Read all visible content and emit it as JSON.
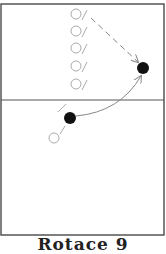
{
  "diagram": {
    "caption": "Rotace 9",
    "colors": {
      "frame": "#555555",
      "hollow": "#aaaaaa",
      "filled": "#111111",
      "arrow": "#888888"
    },
    "court": {
      "x": 1,
      "y": 4,
      "width": 163,
      "height": 231,
      "center_line_y": 100
    },
    "waiting_players": [
      {
        "cx": 76,
        "cy": 14
      },
      {
        "cx": 76,
        "cy": 31
      },
      {
        "cx": 76,
        "cy": 48
      },
      {
        "cx": 76,
        "cy": 66
      },
      {
        "cx": 76,
        "cy": 84
      }
    ],
    "active_players": [
      {
        "cx": 143,
        "cy": 68
      },
      {
        "cx": 70,
        "cy": 118
      }
    ],
    "extra_hollow_player": {
      "cx": 56,
      "cy": 137
    }
  }
}
